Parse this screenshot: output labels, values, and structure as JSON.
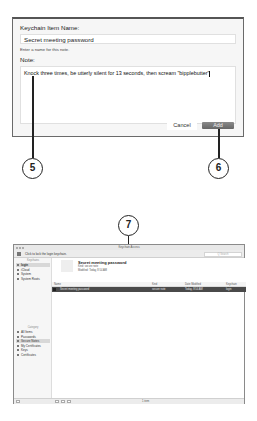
{
  "dialog": {
    "name_label": "Keychain Item Name:",
    "name_value": "Secret meeting password",
    "name_hint": "Enter a name for this note.",
    "note_label": "Note:",
    "note_value": "Knock three times, be utterly silent for 13 seconds, then scream \"bipplebutter\"",
    "cancel_label": "Cancel",
    "add_label": "Add"
  },
  "callouts": [
    "5",
    "6",
    "7"
  ],
  "keychain_window": {
    "title": "Keychain Access",
    "toolbar": {
      "unlock_text": "Click to lock the login keychain.",
      "search_placeholder": "Q Search"
    },
    "sidebar": {
      "keychains_heading": "Keychains",
      "keychains": [
        {
          "label": "login",
          "selected": true
        },
        {
          "label": "iCloud",
          "selected": false
        },
        {
          "label": "System",
          "selected": false
        },
        {
          "label": "System Roots",
          "selected": false
        }
      ],
      "category_heading": "Category",
      "categories": [
        {
          "label": "All Items",
          "selected": false
        },
        {
          "label": "Passwords",
          "selected": false
        },
        {
          "label": "Secure Notes",
          "selected": true
        },
        {
          "label": "My Certificates",
          "selected": false
        },
        {
          "label": "Keys",
          "selected": false
        },
        {
          "label": "Certificates",
          "selected": false
        }
      ]
    },
    "detail": {
      "title": "Secret meeting password",
      "kind_line": "Kind: secure note",
      "modified_line": "Modified: Today, 8:54 AM"
    },
    "table": {
      "columns": [
        "Name",
        "Kind",
        "Date Modified",
        "Keychain"
      ],
      "rows": [
        {
          "name": "Secret meeting password",
          "kind": "secure note",
          "date": "Today, 8:54 AM",
          "keychain": "login"
        }
      ]
    },
    "status": {
      "count": "1 item"
    }
  }
}
